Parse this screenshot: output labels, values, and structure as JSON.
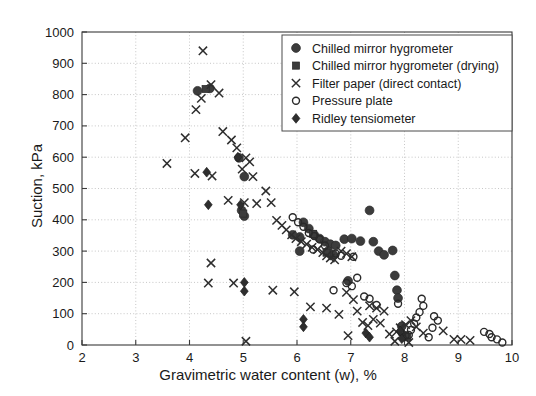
{
  "chart_data": {
    "type": "scatter",
    "title": "",
    "xlabel": "Gravimetric water content (w), %",
    "ylabel": "Suction, kPa",
    "xlim": [
      2,
      10
    ],
    "ylim": [
      0,
      1000
    ],
    "xticks": [
      2,
      3,
      4,
      5,
      6,
      7,
      8,
      9,
      10
    ],
    "yticks": [
      0,
      100,
      200,
      300,
      400,
      500,
      600,
      700,
      800,
      900,
      1000
    ],
    "grid": true,
    "legend_position": "top-right",
    "series": [
      {
        "name": "Chilled mirror hygrometer",
        "marker": "circle-filled",
        "points": [
          [
            4.15,
            812
          ],
          [
            4.38,
            820
          ],
          [
            4.92,
            598
          ],
          [
            5.02,
            538
          ],
          [
            4.97,
            430
          ],
          [
            5.02,
            412
          ],
          [
            6.12,
            392
          ],
          [
            6.22,
            372
          ],
          [
            6.32,
            352
          ],
          [
            6.42,
            340
          ],
          [
            6.05,
            345
          ],
          [
            6.52,
            330
          ],
          [
            6.62,
            322
          ],
          [
            6.72,
            318
          ],
          [
            6.88,
            338
          ],
          [
            7.02,
            340
          ],
          [
            7.18,
            332
          ],
          [
            7.35,
            430
          ],
          [
            7.42,
            330
          ],
          [
            7.52,
            300
          ],
          [
            7.62,
            288
          ],
          [
            7.78,
            302
          ],
          [
            7.82,
            222
          ],
          [
            7.86,
            175
          ],
          [
            7.88,
            150
          ],
          [
            6.58,
            300
          ],
          [
            6.68,
            288
          ],
          [
            6.95,
            205
          ],
          [
            7.95,
            60
          ],
          [
            8.02,
            28
          ],
          [
            6.05,
            300
          ],
          [
            5.92,
            352
          ]
        ]
      },
      {
        "name": "Chilled mirror hygrometer (drying)",
        "marker": "square-filled",
        "points": [
          [
            4.3,
            818
          ],
          [
            5.0,
            420
          ],
          [
            6.3,
            355
          ],
          [
            6.55,
            295
          ],
          [
            8.05,
            25
          ]
        ]
      },
      {
        "name": "Filter paper (direct contact)",
        "marker": "cross",
        "points": [
          [
            4.25,
            940
          ],
          [
            4.4,
            832
          ],
          [
            4.55,
            805
          ],
          [
            4.22,
            788
          ],
          [
            4.12,
            752
          ],
          [
            3.58,
            580
          ],
          [
            3.92,
            662
          ],
          [
            4.1,
            548
          ],
          [
            4.42,
            540
          ],
          [
            4.62,
            682
          ],
          [
            4.78,
            655
          ],
          [
            4.88,
            630
          ],
          [
            5.05,
            598
          ],
          [
            5.12,
            585
          ],
          [
            4.98,
            562
          ],
          [
            5.18,
            538
          ],
          [
            4.72,
            462
          ],
          [
            5.02,
            455
          ],
          [
            5.25,
            452
          ],
          [
            5.42,
            492
          ],
          [
            5.52,
            455
          ],
          [
            4.4,
            262
          ],
          [
            4.35,
            198
          ],
          [
            4.82,
            198
          ],
          [
            5.62,
            398
          ],
          [
            5.72,
            382
          ],
          [
            5.8,
            368
          ],
          [
            5.9,
            352
          ],
          [
            5.98,
            340
          ],
          [
            6.08,
            330
          ],
          [
            6.18,
            322
          ],
          [
            6.28,
            312
          ],
          [
            6.38,
            305
          ],
          [
            6.48,
            295
          ],
          [
            6.55,
            285
          ],
          [
            6.62,
            278
          ],
          [
            6.7,
            272
          ],
          [
            6.82,
            300
          ],
          [
            6.92,
            292
          ],
          [
            7.02,
            282
          ],
          [
            5.55,
            175
          ],
          [
            5.95,
            170
          ],
          [
            6.25,
            122
          ],
          [
            6.55,
            118
          ],
          [
            6.78,
            98
          ],
          [
            6.92,
            168
          ],
          [
            7.05,
            145
          ],
          [
            7.12,
            108
          ],
          [
            7.22,
            72
          ],
          [
            7.32,
            62
          ],
          [
            7.42,
            82
          ],
          [
            7.55,
            70
          ],
          [
            7.35,
            125
          ],
          [
            7.48,
            118
          ],
          [
            7.62,
            108
          ],
          [
            7.72,
            35
          ],
          [
            7.85,
            42
          ],
          [
            7.92,
            55
          ],
          [
            8.02,
            65
          ],
          [
            8.12,
            78
          ],
          [
            8.22,
            58
          ],
          [
            8.35,
            38
          ],
          [
            8.72,
            45
          ],
          [
            8.92,
            18
          ],
          [
            9.22,
            15
          ],
          [
            9.05,
            18
          ],
          [
            6.95,
            30
          ],
          [
            5.05,
            12
          ],
          [
            7.82,
            12
          ],
          [
            8.08,
            8
          ]
        ]
      },
      {
        "name": "Pressure plate",
        "marker": "circle-open",
        "points": [
          [
            5.92,
            408
          ],
          [
            6.02,
            392
          ],
          [
            6.12,
            378
          ],
          [
            6.22,
            358
          ],
          [
            6.32,
            348
          ],
          [
            6.42,
            338
          ],
          [
            6.52,
            318
          ],
          [
            6.3,
            305
          ],
          [
            6.72,
            292
          ],
          [
            6.82,
            285
          ],
          [
            6.92,
            198
          ],
          [
            7.02,
            188
          ],
          [
            7.12,
            215
          ],
          [
            7.25,
            155
          ],
          [
            7.35,
            148
          ],
          [
            7.05,
            282
          ],
          [
            7.48,
            128
          ],
          [
            7.88,
            132
          ],
          [
            7.95,
            38
          ],
          [
            8.02,
            30
          ],
          [
            8.32,
            148
          ],
          [
            8.35,
            125
          ],
          [
            8.28,
            105
          ],
          [
            8.22,
            88
          ],
          [
            8.18,
            68
          ],
          [
            8.12,
            48
          ],
          [
            8.08,
            32
          ],
          [
            8.55,
            92
          ],
          [
            8.62,
            78
          ],
          [
            8.52,
            55
          ],
          [
            9.48,
            42
          ],
          [
            9.58,
            35
          ],
          [
            9.62,
            25
          ],
          [
            9.72,
            18
          ],
          [
            9.82,
            8
          ],
          [
            6.68,
            175
          ],
          [
            8.45,
            25
          ]
        ]
      },
      {
        "name": "Ridley tensiometer",
        "marker": "diamond",
        "points": [
          [
            4.32,
            552
          ],
          [
            4.35,
            448
          ],
          [
            4.9,
            600
          ],
          [
            4.95,
            448
          ],
          [
            5.02,
            200
          ],
          [
            5.02,
            172
          ],
          [
            6.12,
            82
          ],
          [
            6.12,
            58
          ],
          [
            7.28,
            38
          ],
          [
            7.35,
            25
          ],
          [
            7.92,
            45
          ],
          [
            7.95,
            20
          ]
        ]
      }
    ]
  },
  "legend": {
    "items": [
      {
        "label": "Chilled mirror hygrometer",
        "marker": "circle-filled"
      },
      {
        "label": "Chilled mirror hygrometer (drying)",
        "marker": "square-filled"
      },
      {
        "label": "Filter paper (direct contact)",
        "marker": "cross"
      },
      {
        "label": "Pressure plate",
        "marker": "circle-open"
      },
      {
        "label": "Ridley tensiometer",
        "marker": "diamond"
      }
    ]
  },
  "colors": {
    "marker": "#3c3c3c",
    "grid": "#b9b9b9",
    "frame": "#3a3a3a",
    "text": "#1a1a1a",
    "background": "#ffffff"
  }
}
